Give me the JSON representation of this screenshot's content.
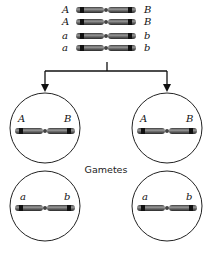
{
  "diagram": {
    "parent_cell": {
      "chromosomes": [
        {
          "left": "A",
          "right": "B"
        },
        {
          "left": "A",
          "right": "B"
        },
        {
          "left": "a",
          "right": "b"
        },
        {
          "left": "a",
          "right": "b"
        }
      ]
    },
    "caption": "Gametes",
    "gametes": [
      {
        "left": "A",
        "right": "B"
      },
      {
        "left": "A",
        "right": "B"
      },
      {
        "left": "a",
        "right": "b"
      },
      {
        "left": "a",
        "right": "b"
      }
    ],
    "colors": {
      "chromosome_body": "#6e6e6e",
      "chromosome_band": "#1a1a1a",
      "line": "#111111"
    }
  }
}
